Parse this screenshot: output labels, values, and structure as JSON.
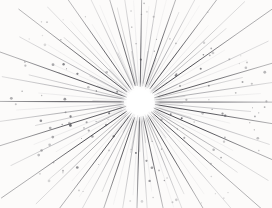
{
  "image": {
    "title": "Sunburst / Starburst Engraving",
    "description": "Vintage engraving-style radial burst of fine lines emanating from a bright white central void, with scattered stipple dots",
    "style": "antique line engraving",
    "width": 272,
    "height": 208
  },
  "canvas": {
    "width": 272,
    "height": 208,
    "background_color": "#fcfbfa"
  },
  "burst": {
    "center_x": 140,
    "center_y": 102,
    "core_radius": 13,
    "core_color": "#ffffff",
    "ray_count": 76,
    "ray_color_dark": "#3f3f44",
    "ray_color_mid": "#6e6e75",
    "ray_color_light": "#a9a9b0",
    "dot_count": 150,
    "dot_color": "#4a4a50",
    "inner_start_radius": 13,
    "max_ray_length": 170
  },
  "rays": [
    {
      "angle": 0,
      "len": 128,
      "w": 0.85,
      "shade": "dark"
    },
    {
      "angle": 5,
      "len": 96,
      "w": 0.55,
      "shade": "mid"
    },
    {
      "angle": 9,
      "len": 142,
      "w": 0.95,
      "shade": "dark"
    },
    {
      "angle": 14,
      "len": 78,
      "w": 0.45,
      "shade": "light"
    },
    {
      "angle": 18,
      "len": 120,
      "w": 0.75,
      "shade": "mid"
    },
    {
      "angle": 23,
      "len": 155,
      "w": 1.0,
      "shade": "dark"
    },
    {
      "angle": 27,
      "len": 88,
      "w": 0.5,
      "shade": "light"
    },
    {
      "angle": 32,
      "len": 134,
      "w": 0.8,
      "shade": "mid"
    },
    {
      "angle": 36,
      "len": 104,
      "w": 0.6,
      "shade": "mid"
    },
    {
      "angle": 41,
      "len": 150,
      "w": 0.95,
      "shade": "dark"
    },
    {
      "angle": 45,
      "len": 82,
      "w": 0.45,
      "shade": "light"
    },
    {
      "angle": 50,
      "len": 126,
      "w": 0.75,
      "shade": "mid"
    },
    {
      "angle": 55,
      "len": 98,
      "w": 0.55,
      "shade": "light"
    },
    {
      "angle": 59,
      "len": 144,
      "w": 0.9,
      "shade": "dark"
    },
    {
      "angle": 64,
      "len": 86,
      "w": 0.5,
      "shade": "mid"
    },
    {
      "angle": 68,
      "len": 118,
      "w": 0.7,
      "shade": "mid"
    },
    {
      "angle": 73,
      "len": 94,
      "w": 0.5,
      "shade": "light"
    },
    {
      "angle": 77,
      "len": 108,
      "w": 0.8,
      "shade": "dark"
    },
    {
      "angle": 82,
      "len": 76,
      "w": 0.45,
      "shade": "light"
    },
    {
      "angle": 86,
      "len": 100,
      "w": 0.65,
      "shade": "mid"
    },
    {
      "angle": 91,
      "len": 112,
      "w": 0.85,
      "shade": "dark"
    },
    {
      "angle": 95,
      "len": 80,
      "w": 0.5,
      "shade": "light"
    },
    {
      "angle": 100,
      "len": 104,
      "w": 0.7,
      "shade": "mid"
    },
    {
      "angle": 104,
      "len": 90,
      "w": 0.5,
      "shade": "light"
    },
    {
      "angle": 109,
      "len": 124,
      "w": 0.9,
      "shade": "dark"
    },
    {
      "angle": 113,
      "len": 84,
      "w": 0.5,
      "shade": "mid"
    },
    {
      "angle": 118,
      "len": 130,
      "w": 0.75,
      "shade": "mid"
    },
    {
      "angle": 122,
      "len": 96,
      "w": 0.5,
      "shade": "light"
    },
    {
      "angle": 127,
      "len": 146,
      "w": 0.95,
      "shade": "dark"
    },
    {
      "angle": 131,
      "len": 88,
      "w": 0.5,
      "shade": "light"
    },
    {
      "angle": 136,
      "len": 132,
      "w": 0.8,
      "shade": "mid"
    },
    {
      "angle": 140,
      "len": 102,
      "w": 0.6,
      "shade": "mid"
    },
    {
      "angle": 145,
      "len": 152,
      "w": 1.0,
      "shade": "dark"
    },
    {
      "angle": 149,
      "len": 84,
      "w": 0.45,
      "shade": "light"
    },
    {
      "angle": 154,
      "len": 128,
      "w": 0.75,
      "shade": "mid"
    },
    {
      "angle": 158,
      "len": 100,
      "w": 0.55,
      "shade": "light"
    },
    {
      "angle": 163,
      "len": 140,
      "w": 0.9,
      "shade": "dark"
    },
    {
      "angle": 167,
      "len": 92,
      "w": 0.5,
      "shade": "mid"
    },
    {
      "angle": 172,
      "len": 134,
      "w": 0.8,
      "shade": "mid"
    },
    {
      "angle": 176,
      "len": 110,
      "w": 0.6,
      "shade": "light"
    },
    {
      "angle": 181,
      "len": 142,
      "w": 0.95,
      "shade": "dark"
    },
    {
      "angle": 185,
      "len": 88,
      "w": 0.5,
      "shade": "light"
    },
    {
      "angle": 190,
      "len": 126,
      "w": 0.75,
      "shade": "mid"
    },
    {
      "angle": 194,
      "len": 98,
      "w": 0.55,
      "shade": "mid"
    },
    {
      "angle": 199,
      "len": 148,
      "w": 0.95,
      "shade": "dark"
    },
    {
      "angle": 203,
      "len": 82,
      "w": 0.45,
      "shade": "light"
    },
    {
      "angle": 208,
      "len": 122,
      "w": 0.75,
      "shade": "mid"
    },
    {
      "angle": 212,
      "len": 94,
      "w": 0.5,
      "shade": "light"
    },
    {
      "angle": 217,
      "len": 136,
      "w": 0.9,
      "shade": "dark"
    },
    {
      "angle": 221,
      "len": 86,
      "w": 0.5,
      "shade": "mid"
    },
    {
      "angle": 226,
      "len": 118,
      "w": 0.7,
      "shade": "mid"
    },
    {
      "angle": 230,
      "len": 92,
      "w": 0.5,
      "shade": "light"
    },
    {
      "angle": 235,
      "len": 112,
      "w": 0.85,
      "shade": "dark"
    },
    {
      "angle": 239,
      "len": 78,
      "w": 0.45,
      "shade": "light"
    },
    {
      "angle": 244,
      "len": 98,
      "w": 0.65,
      "shade": "mid"
    },
    {
      "angle": 248,
      "len": 88,
      "w": 0.5,
      "shade": "light"
    },
    {
      "angle": 253,
      "len": 106,
      "w": 0.8,
      "shade": "dark"
    },
    {
      "angle": 257,
      "len": 80,
      "w": 0.5,
      "shade": "mid"
    },
    {
      "angle": 262,
      "len": 100,
      "w": 0.7,
      "shade": "mid"
    },
    {
      "angle": 266,
      "len": 86,
      "w": 0.5,
      "shade": "light"
    },
    {
      "angle": 271,
      "len": 110,
      "w": 0.85,
      "shade": "dark"
    },
    {
      "angle": 275,
      "len": 82,
      "w": 0.5,
      "shade": "light"
    },
    {
      "angle": 280,
      "len": 102,
      "w": 0.7,
      "shade": "mid"
    },
    {
      "angle": 284,
      "len": 90,
      "w": 0.5,
      "shade": "light"
    },
    {
      "angle": 289,
      "len": 120,
      "w": 0.9,
      "shade": "dark"
    },
    {
      "angle": 293,
      "len": 84,
      "w": 0.5,
      "shade": "mid"
    },
    {
      "angle": 298,
      "len": 128,
      "w": 0.75,
      "shade": "mid"
    },
    {
      "angle": 302,
      "len": 96,
      "w": 0.5,
      "shade": "light"
    },
    {
      "angle": 307,
      "len": 144,
      "w": 0.95,
      "shade": "dark"
    },
    {
      "angle": 311,
      "len": 88,
      "w": 0.5,
      "shade": "light"
    },
    {
      "angle": 316,
      "len": 130,
      "w": 0.8,
      "shade": "mid"
    },
    {
      "angle": 320,
      "len": 100,
      "w": 0.6,
      "shade": "mid"
    },
    {
      "angle": 325,
      "len": 150,
      "w": 1.0,
      "shade": "dark"
    },
    {
      "angle": 329,
      "len": 84,
      "w": 0.45,
      "shade": "light"
    },
    {
      "angle": 334,
      "len": 126,
      "w": 0.75,
      "shade": "mid"
    },
    {
      "angle": 338,
      "len": 98,
      "w": 0.55,
      "shade": "light"
    },
    {
      "angle": 343,
      "len": 138,
      "w": 0.9,
      "shade": "dark"
    },
    {
      "angle": 347,
      "len": 90,
      "w": 0.5,
      "shade": "mid"
    },
    {
      "angle": 352,
      "len": 132,
      "w": 0.8,
      "shade": "mid"
    },
    {
      "angle": 356,
      "len": 106,
      "w": 0.6,
      "shade": "light"
    }
  ]
}
